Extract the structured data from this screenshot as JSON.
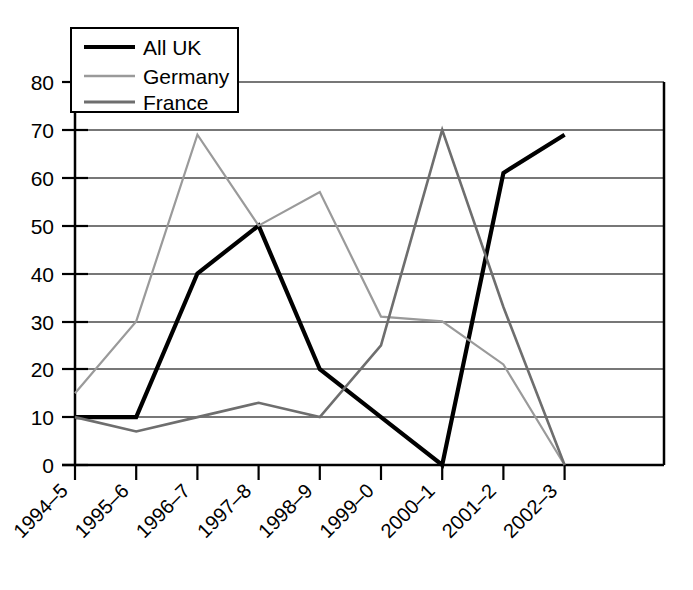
{
  "chart_data": {
    "type": "line",
    "title": "",
    "xlabel": "",
    "ylabel": "",
    "ylim": [
      0,
      80
    ],
    "ytick_step": 10,
    "grid": true,
    "legend_position": "top-left",
    "categories": [
      "1994–5",
      "1995–6",
      "1996–7",
      "1997–8",
      "1998–9",
      "1999–0",
      "2000–1",
      "2001–2",
      "2002–3"
    ],
    "ytick_labels": [
      "0",
      "10",
      "20",
      "30",
      "40",
      "50",
      "60",
      "70",
      "80"
    ],
    "series": [
      {
        "name": "All UK",
        "color": "#000000",
        "stroke_width": 4.2,
        "values": [
          10,
          10,
          40,
          50,
          20,
          10,
          0,
          61,
          69
        ]
      },
      {
        "name": "Germany",
        "color": "#9a9a9a",
        "stroke_width": 2.2,
        "values": [
          15,
          30,
          69,
          50,
          57,
          31,
          30,
          21,
          0
        ]
      },
      {
        "name": "France",
        "color": "#6e6e6e",
        "stroke_width": 2.6,
        "values": [
          10,
          7,
          10,
          13,
          10,
          25,
          70,
          33,
          0
        ]
      }
    ]
  },
  "legend": {
    "items": [
      {
        "label": "All UK",
        "swatch": "line-swatch-all-uk"
      },
      {
        "label": "Germany",
        "swatch": "line-swatch-germany"
      },
      {
        "label": "France",
        "swatch": "line-swatch-france"
      }
    ]
  }
}
